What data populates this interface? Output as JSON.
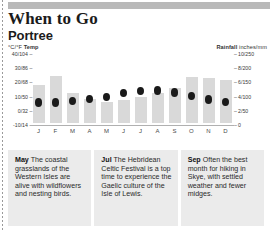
{
  "header": {
    "title": "When to Go",
    "subtitle": "Portree"
  },
  "legend": {
    "left_units": "°C/°F",
    "left_label": "Temp",
    "right_label": "Rainfall",
    "right_units": "inches/mm"
  },
  "chart_data": {
    "type": "bar",
    "categories": [
      "J",
      "F",
      "M",
      "A",
      "M",
      "J",
      "J",
      "A",
      "S",
      "O",
      "N",
      "D"
    ],
    "month_names": [
      "January",
      "February",
      "March",
      "April",
      "May",
      "June",
      "July",
      "August",
      "September",
      "October",
      "November",
      "December"
    ],
    "series": [
      {
        "name": "Rainfall",
        "type": "bar",
        "unit": "inches/mm",
        "values": [
          5.4,
          6.6,
          4.2,
          3.4,
          3.0,
          3.2,
          3.6,
          4.2,
          5.0,
          6.5,
          6.4,
          6.0
        ],
        "values_mm": [
          135,
          165,
          105,
          85,
          75,
          80,
          90,
          105,
          125,
          162,
          160,
          150
        ]
      },
      {
        "name": "Temp",
        "type": "scatter",
        "unit": "°C/°F",
        "values_c": [
          4.5,
          4.5,
          5.5,
          7.0,
          8.5,
          11.0,
          12.5,
          13.0,
          11.5,
          9.0,
          6.5,
          5.0
        ],
        "values_f": [
          40,
          40,
          42,
          45,
          47,
          52,
          55,
          55,
          53,
          48,
          44,
          41
        ]
      }
    ],
    "left_axis": {
      "label": "°C/°F Temp",
      "ticks": [
        "40/104",
        "30/86",
        "20/68",
        "10/50",
        "0/32",
        "-10/14"
      ],
      "values_c": [
        40,
        30,
        20,
        10,
        0,
        -10
      ],
      "ylim": [
        -10,
        40
      ]
    },
    "right_axis": {
      "label": "Rainfall inches/mm",
      "ticks": [
        "10/250",
        "8/200",
        "6/150",
        "4/100",
        "2/50",
        "0"
      ],
      "values_in": [
        10,
        8,
        6,
        4,
        2,
        0
      ],
      "ylim": [
        0,
        10
      ]
    },
    "xlabel": "",
    "ylabel": "",
    "grid": false,
    "legend_position": "top"
  },
  "notes": [
    {
      "month": "May",
      "text": " The coastal grasslands of the Western Isles are alive with wildflowers and nesting birds."
    },
    {
      "month": "Jul",
      "text": " The Hebridean Celtic Festival is a top time to experience the Gaelic culture of the Isle of Lewis."
    },
    {
      "month": "Sep",
      "text": " Often the best month for hiking in Skye, with settled weather and fewer midges."
    }
  ],
  "colors": {
    "bar": "#d9d9d9",
    "dot": "#1a1a1a",
    "note_bg": "#ebebeb",
    "banner": "#b9b9b9"
  }
}
